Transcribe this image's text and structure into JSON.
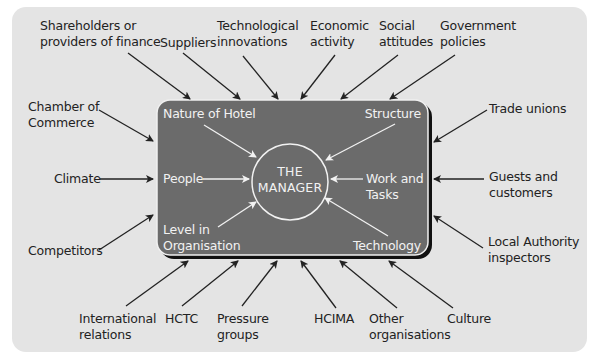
{
  "diagram": {
    "center": {
      "line1": "THE",
      "line2": "MANAGER"
    },
    "internal_factors": [
      {
        "id": "nature-of-hotel",
        "label": "Nature of Hotel"
      },
      {
        "id": "structure",
        "label": "Structure"
      },
      {
        "id": "people",
        "label": "People"
      },
      {
        "id": "work-and-tasks",
        "line1": "Work and",
        "line2": "Tasks"
      },
      {
        "id": "level-in-organisation",
        "line1": "Level in",
        "line2": "Organisation"
      },
      {
        "id": "technology",
        "label": "Technology"
      }
    ],
    "external_factors": {
      "top": [
        {
          "id": "shareholders",
          "line1": "Shareholders or",
          "line2": "providers of finance"
        },
        {
          "id": "suppliers",
          "label": "Suppliers"
        },
        {
          "id": "technological-innovations",
          "line1": "Technological",
          "line2": "innovations"
        },
        {
          "id": "economic-activity",
          "line1": "Economic",
          "line2": "activity"
        },
        {
          "id": "social-attitudes",
          "line1": "Social",
          "line2": "attitudes"
        },
        {
          "id": "government-policies",
          "line1": "Government",
          "line2": "policies"
        }
      ],
      "left": [
        {
          "id": "chamber-of-commerce",
          "line1": "Chamber of",
          "line2": "Commerce"
        },
        {
          "id": "climate",
          "label": "Climate"
        },
        {
          "id": "competitors",
          "label": "Competitors"
        }
      ],
      "right": [
        {
          "id": "trade-unions",
          "label": "Trade unions"
        },
        {
          "id": "guests-and-customers",
          "line1": "Guests and",
          "line2": "customers"
        },
        {
          "id": "local-authority-inspectors",
          "line1": "Local Authority",
          "line2": "inspectors"
        }
      ],
      "bottom": [
        {
          "id": "international-relations",
          "line1": "International",
          "line2": "relations"
        },
        {
          "id": "hctc",
          "label": "HCTC"
        },
        {
          "id": "pressure-groups",
          "line1": "Pressure",
          "line2": "groups"
        },
        {
          "id": "hcima",
          "label": "HCIMA"
        },
        {
          "id": "other-organisations",
          "line1": "Other",
          "line2": "organisations"
        },
        {
          "id": "culture",
          "label": "Culture"
        }
      ]
    },
    "colors": {
      "background_panel": "#e4e4e4",
      "inner_box": "#6b6b6b",
      "inner_border": "#f0f0f0",
      "shadow": "#111111",
      "arrow_external": "#222222",
      "arrow_internal": "#f2f2f2",
      "text_external": "#222222",
      "text_internal": "#f2f2f2"
    }
  }
}
